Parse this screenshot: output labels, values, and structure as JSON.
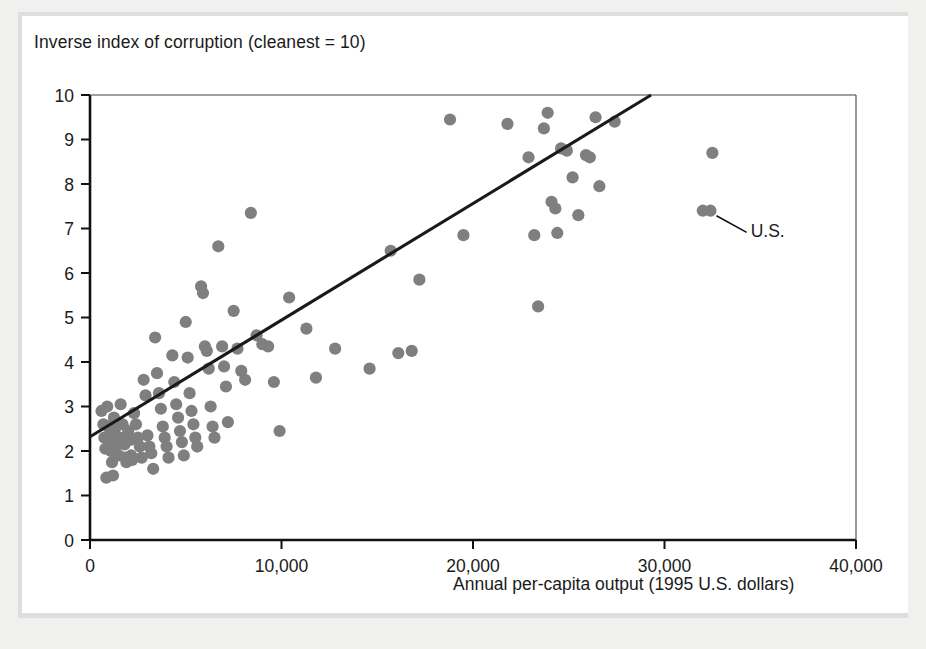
{
  "chart_data": {
    "type": "scatter",
    "title": "Inverse index of corruption (cleanest = 10)",
    "xlabel": "Annual per-capita output (1995 U.S. dollars)",
    "ylabel": "Inverse index of corruption (cleanest = 10)",
    "xlim": [
      0,
      40000
    ],
    "ylim": [
      0,
      10
    ],
    "xticks": [
      0,
      10000,
      20000,
      30000,
      40000
    ],
    "xticklabels": [
      "0",
      "10,000",
      "20,000",
      "30,000",
      "40,000"
    ],
    "yticks": [
      0,
      1,
      2,
      3,
      4,
      5,
      6,
      7,
      8,
      9,
      10
    ],
    "yticklabels": [
      "0",
      "1",
      "2",
      "3",
      "4",
      "5",
      "6",
      "7",
      "8",
      "9",
      "10"
    ],
    "grid": false,
    "legend": null,
    "marker_color": "#7f7f7f",
    "line_color": "#1a1a1a",
    "trendline": {
      "label": "regression line",
      "x": [
        0,
        29300
      ],
      "y": [
        2.32,
        10.0
      ]
    },
    "annotations": [
      {
        "text": "U.S.",
        "point_x": 32400,
        "point_y": 7.4,
        "label_x": 34500,
        "label_y": 6.8
      }
    ],
    "points": [
      [
        600,
        2.9
      ],
      [
        700,
        2.6
      ],
      [
        750,
        2.3
      ],
      [
        800,
        2.05
      ],
      [
        850,
        1.4
      ],
      [
        900,
        3.0
      ],
      [
        950,
        2.55
      ],
      [
        1000,
        2.35
      ],
      [
        1050,
        2.2
      ],
      [
        1100,
        2.0
      ],
      [
        1150,
        1.75
      ],
      [
        1200,
        1.45
      ],
      [
        1250,
        2.75
      ],
      [
        1300,
        2.5
      ],
      [
        1350,
        2.35
      ],
      [
        1400,
        2.3
      ],
      [
        1450,
        2.15
      ],
      [
        1500,
        1.9
      ],
      [
        1600,
        3.05
      ],
      [
        1700,
        2.6
      ],
      [
        1750,
        2.3
      ],
      [
        1800,
        2.15
      ],
      [
        1850,
        1.85
      ],
      [
        1900,
        1.75
      ],
      [
        2000,
        2.45
      ],
      [
        2100,
        2.25
      ],
      [
        2150,
        1.9
      ],
      [
        2200,
        1.8
      ],
      [
        2300,
        2.85
      ],
      [
        2400,
        2.6
      ],
      [
        2500,
        2.3
      ],
      [
        2600,
        2.1
      ],
      [
        2700,
        1.85
      ],
      [
        2800,
        3.6
      ],
      [
        2900,
        3.25
      ],
      [
        3000,
        2.35
      ],
      [
        3100,
        2.1
      ],
      [
        3200,
        1.95
      ],
      [
        3300,
        1.6
      ],
      [
        3400,
        4.55
      ],
      [
        3500,
        3.75
      ],
      [
        3600,
        3.3
      ],
      [
        3700,
        2.95
      ],
      [
        3800,
        2.55
      ],
      [
        3900,
        2.3
      ],
      [
        4000,
        2.1
      ],
      [
        4100,
        1.85
      ],
      [
        4300,
        4.15
      ],
      [
        4400,
        3.55
      ],
      [
        4500,
        3.05
      ],
      [
        4600,
        2.75
      ],
      [
        4700,
        2.45
      ],
      [
        4800,
        2.2
      ],
      [
        4900,
        1.9
      ],
      [
        5000,
        4.9
      ],
      [
        5100,
        4.1
      ],
      [
        5200,
        3.3
      ],
      [
        5300,
        2.9
      ],
      [
        5400,
        2.6
      ],
      [
        5500,
        2.3
      ],
      [
        5600,
        2.1
      ],
      [
        5800,
        5.7
      ],
      [
        5900,
        5.55
      ],
      [
        6000,
        4.35
      ],
      [
        6100,
        4.25
      ],
      [
        6200,
        3.85
      ],
      [
        6300,
        3.0
      ],
      [
        6400,
        2.55
      ],
      [
        6500,
        2.3
      ],
      [
        6700,
        6.6
      ],
      [
        6900,
        4.35
      ],
      [
        7000,
        3.9
      ],
      [
        7100,
        3.45
      ],
      [
        7200,
        2.65
      ],
      [
        7500,
        5.15
      ],
      [
        7700,
        4.3
      ],
      [
        7900,
        3.8
      ],
      [
        8100,
        3.6
      ],
      [
        8400,
        7.35
      ],
      [
        8700,
        4.6
      ],
      [
        9000,
        4.4
      ],
      [
        9300,
        4.35
      ],
      [
        9600,
        3.55
      ],
      [
        9900,
        2.45
      ],
      [
        10400,
        5.45
      ],
      [
        11300,
        4.75
      ],
      [
        11800,
        3.65
      ],
      [
        12800,
        4.3
      ],
      [
        14600,
        3.85
      ],
      [
        15700,
        6.5
      ],
      [
        16100,
        4.2
      ],
      [
        16800,
        4.25
      ],
      [
        17200,
        5.85
      ],
      [
        18800,
        9.45
      ],
      [
        19500,
        6.85
      ],
      [
        21800,
        9.35
      ],
      [
        22900,
        8.6
      ],
      [
        23200,
        6.85
      ],
      [
        23400,
        5.25
      ],
      [
        23700,
        9.25
      ],
      [
        23900,
        9.6
      ],
      [
        24100,
        7.6
      ],
      [
        24300,
        7.45
      ],
      [
        24400,
        6.9
      ],
      [
        24600,
        8.8
      ],
      [
        24900,
        8.75
      ],
      [
        25200,
        8.15
      ],
      [
        25500,
        7.3
      ],
      [
        25900,
        8.65
      ],
      [
        26100,
        8.6
      ],
      [
        26400,
        9.5
      ],
      [
        26600,
        7.95
      ],
      [
        27400,
        9.4
      ],
      [
        32000,
        7.4
      ],
      [
        32400,
        7.4
      ],
      [
        32500,
        8.7
      ]
    ]
  },
  "figure": {
    "title": "Inverse index of corruption (cleanest = 10)",
    "xaxis_label": "Annual per-capita output (1995 U.S. dollars)"
  }
}
